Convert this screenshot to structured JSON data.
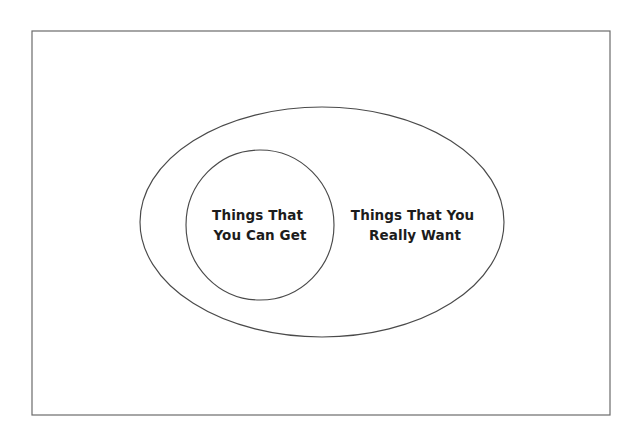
{
  "figure": {
    "type": "venn-subset-diagram",
    "background_color": "#ffffff",
    "border": {
      "name": "outer-frame",
      "stroke_color": "#6b6b6b",
      "x": 32,
      "y": 31,
      "width": 578,
      "height": 384
    }
  },
  "sets": {
    "outer": {
      "name": "things-that-you-really-want",
      "label_line1": "Things That You",
      "label_line2": "Really Want",
      "stroke_color": "#4a4a4a",
      "cx": 322,
      "cy": 222,
      "rx": 182,
      "ry": 115,
      "label_cx": 415,
      "label_cy": 226
    },
    "inner": {
      "name": "things-that-you-can-get",
      "label_line1": "Things That",
      "label_line2": "You Can Get",
      "stroke_color": "#4a4a4a",
      "cx": 260,
      "cy": 225,
      "rx": 74,
      "ry": 75,
      "label_cx": 260,
      "label_cy": 226
    }
  }
}
